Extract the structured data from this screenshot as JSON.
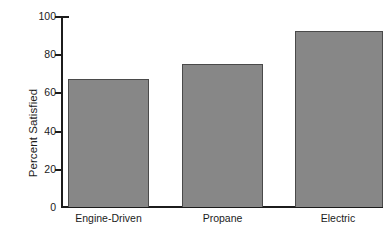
{
  "chart_data": {
    "type": "bar",
    "title": "",
    "subtitle": "",
    "xlabel": "",
    "ylabel": "Percent Satisfied",
    "categories": [
      "Engine-Driven",
      "Propane",
      "Electric"
    ],
    "values": [
      67,
      75,
      92
    ],
    "ylim": [
      0,
      100
    ],
    "yticks": [
      0,
      20,
      40,
      60,
      80,
      100
    ],
    "ytick_labels": [
      "0",
      "20",
      "40",
      "60",
      "80",
      "100"
    ],
    "grid": false,
    "legend": null,
    "annotations": [],
    "series": [
      {
        "name": "Percent Satisfied",
        "values": [
          67,
          75,
          92
        ]
      }
    ],
    "colors": {
      "bar_fill": "#878787",
      "bar_edge": "#4a4a4a",
      "axis": "#1c1c1c",
      "text": "#1b1b1b",
      "background": "#ffffff"
    }
  }
}
